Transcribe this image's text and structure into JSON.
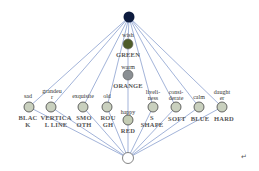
{
  "diagram": {
    "type": "lattice-graph",
    "top_node": {
      "id": "top",
      "color": "#0d1b3e"
    },
    "bottom_node": {
      "id": "bottom",
      "color": "#ffffff"
    },
    "edge_color": "#4a6bb5",
    "center_nodes": [
      {
        "id": "green",
        "attribute": "wish",
        "concept": "GREEN",
        "color": "#4f5d2a"
      },
      {
        "id": "orange",
        "attribute": "warm",
        "concept": "ORANGE",
        "color": "#8a8f93"
      },
      {
        "id": "red",
        "attribute": "happy",
        "concept": "RED",
        "color": "#c4ccb4"
      }
    ],
    "row_nodes": [
      {
        "id": "black",
        "attribute": "sad",
        "concept_line1": "BLAC",
        "concept_line2": "K"
      },
      {
        "id": "vertical-line",
        "attribute_line1": "grandeu",
        "attribute_line2": "r",
        "concept_line1": "VERTICA",
        "concept_line2": "L LINE"
      },
      {
        "id": "smooth",
        "attribute": "exquisite",
        "concept_line1": "SMO",
        "concept_line2": "OTH"
      },
      {
        "id": "rough",
        "attribute": "old",
        "concept_line1": "ROU",
        "concept_line2": "GH"
      },
      {
        "id": "s-shape",
        "attribute_line1": "liveli-",
        "attribute_line2": "ness",
        "concept_line1": "S",
        "concept_line2": "SHAPE"
      },
      {
        "id": "soft",
        "attribute_line1": "consi-",
        "attribute_line2": "derate",
        "concept_line1": "SOFT"
      },
      {
        "id": "blue",
        "attribute": "calm",
        "concept_line1": "BLUE"
      },
      {
        "id": "hard",
        "attribute_line1": "daught",
        "attribute_line2": "er",
        "concept_line1": "HARD"
      }
    ],
    "footer_mark": "↵",
    "row_node_color": "#c9d0be"
  }
}
